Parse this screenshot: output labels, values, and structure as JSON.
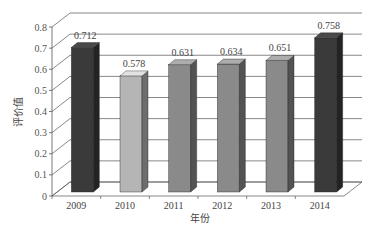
{
  "chart_data": {
    "type": "bar",
    "style": "3d-column",
    "title": "",
    "xlabel": "年份",
    "ylabel": "评价值",
    "categories": [
      "2009",
      "2010",
      "2011",
      "2012",
      "2013",
      "2014"
    ],
    "values": [
      0.712,
      0.578,
      0.631,
      0.634,
      0.651,
      0.758
    ],
    "value_labels": [
      "0.712",
      "0.578",
      "0.631",
      "0.634",
      "0.651",
      "0.758"
    ],
    "bar_colors": [
      "#3a3a3a",
      "#b5b5b5",
      "#8a8a8a",
      "#8a8a8a",
      "#8a8a8a",
      "#3a3a3a"
    ],
    "ylim": [
      0,
      0.8
    ],
    "yticks": [
      "0",
      "0.1",
      "0.2",
      "0.3",
      "0.4",
      "0.5",
      "0.6",
      "0.7",
      "0.8"
    ],
    "grid": true,
    "legend": null
  }
}
